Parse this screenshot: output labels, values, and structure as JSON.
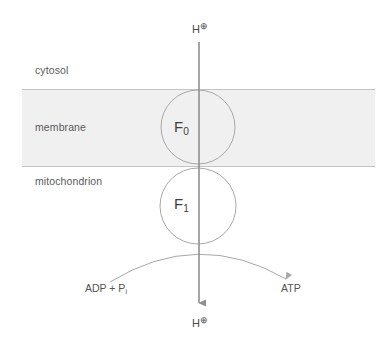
{
  "figure": {
    "width": 391,
    "height": 354,
    "background_color": "#ffffff"
  },
  "compartments": [
    {
      "key": "cytosol",
      "label": "cytosol"
    },
    {
      "key": "membrane",
      "label": "membrane"
    },
    {
      "key": "mitochondrion",
      "label": "mitochondrion"
    }
  ],
  "membrane_band": {
    "fill_color": "#f0f0f0",
    "edge_color": "#c9c9c9",
    "top_y": 89,
    "bottom_y": 166,
    "left_x": 22,
    "right_x": 375
  },
  "subunits": [
    {
      "key": "f0",
      "letter": "F",
      "subscript": "0",
      "cx": 198,
      "cy": 127,
      "r": 37
    },
    {
      "key": "f1",
      "letter": "F",
      "subscript": "1",
      "cx": 198,
      "cy": 206,
      "r": 38
    }
  ],
  "proton": {
    "top_label": "H",
    "bottom_label": "H",
    "charge_symbol": "⊕",
    "arrow_color": "#8f8f8f",
    "arrow_x": 199,
    "arrow_top_y": 42,
    "arrow_bottom_y": 308
  },
  "reaction": {
    "substrate_label": "ADP + P",
    "substrate_subscript": "i",
    "product_label": "ATP",
    "arc_color": "#a8a8a8"
  },
  "colors": {
    "stroke": "#a8a8a8",
    "text": "#4a4a4a",
    "band_fill": "#f0f0f0",
    "arrow": "#8f8f8f"
  }
}
